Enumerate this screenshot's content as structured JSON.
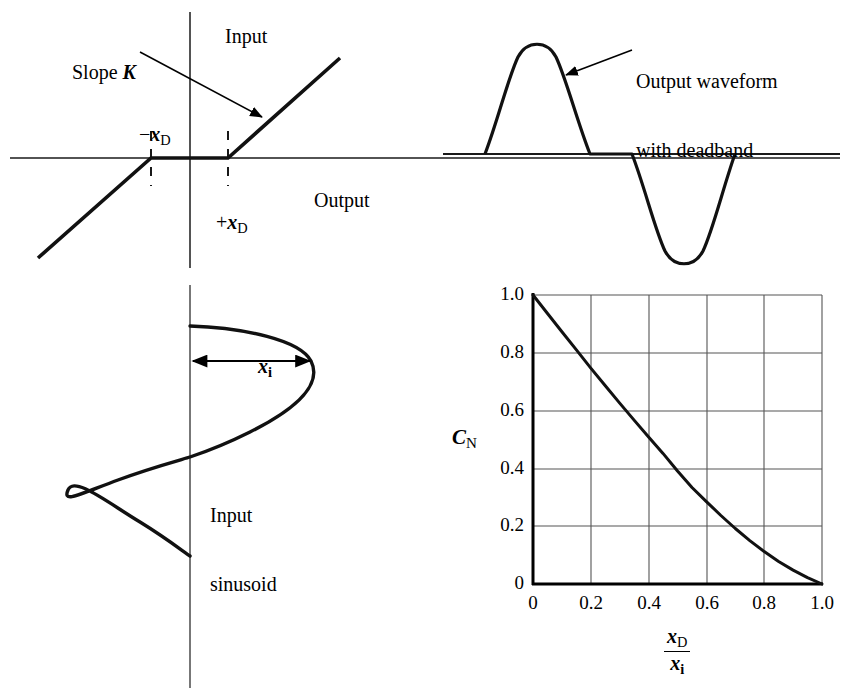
{
  "transfer_plot": {
    "axis_input_label": "Input",
    "axis_output_label": "Output",
    "slope_label_prefix": "Slope ",
    "slope_label_symbol": "K",
    "deadband_neg_sign": "−",
    "deadband_pos_sign": "+",
    "deadband_symbol": "x",
    "deadband_subscript": "D",
    "geometry": {
      "origin_x": 190,
      "origin_y": 158,
      "axis_x_left": 10,
      "axis_x_right": 840,
      "axis_y_top": 12,
      "axis_y_bottom": 268,
      "deadband_neg_x": 151,
      "deadband_pos_x": 228,
      "line_low_x": 38,
      "line_low_y": 258,
      "line_high_x": 340,
      "line_high_y": 58
    }
  },
  "output_waveform": {
    "annotation_line1": "Output waveform",
    "annotation_line2": "with deadband",
    "geometry": {
      "baseline_y": 154,
      "baseline_x_start": 443,
      "baseline_x_end": 840,
      "pos_start_x": 485,
      "pos_end_x": 590,
      "pos_peak_x": 537,
      "pos_peak_y": 42,
      "neg_start_x": 632,
      "neg_end_x": 735,
      "neg_trough_x": 684,
      "neg_trough_y": 267
    }
  },
  "input_sinusoid": {
    "label_line1": "Input",
    "label_line2": "sinusoid",
    "amplitude_symbol": "x",
    "amplitude_subscript": "i",
    "geometry": {
      "axis_x": 190,
      "axis_y_top": 285,
      "axis_y_bottom": 688,
      "peak_pos_x": 312,
      "peak_pos_y": 361,
      "peak_neg_x": 68,
      "peak_neg_y": 490,
      "wave_y_start": 326,
      "wave_y_end": 556,
      "arrow_y": 361,
      "arrow_x_start": 192,
      "arrow_x_end": 311
    }
  },
  "chart_data": {
    "type": "line",
    "title": "",
    "xlabel_numerator_symbol": "x",
    "xlabel_numerator_subscript": "D",
    "xlabel_denominator_symbol": "x",
    "xlabel_denominator_subscript": "i",
    "ylabel_symbol": "C",
    "ylabel_subscript": "N",
    "xlim": [
      0,
      1.0
    ],
    "ylim": [
      0,
      1.0
    ],
    "grid": true,
    "legend": "none",
    "xticks": [
      "0",
      "0.2",
      "0.4",
      "0.6",
      "0.8",
      "1.0"
    ],
    "xtick_values": [
      0,
      0.2,
      0.4,
      0.6,
      0.8,
      1.0
    ],
    "yticks": [
      "0",
      "0.2",
      "0.4",
      "0.6",
      "0.8",
      "1.0"
    ],
    "ytick_values": [
      0,
      0.2,
      0.4,
      0.6,
      0.8,
      1.0
    ],
    "series": [
      {
        "name": "C_N",
        "x": [
          0.0,
          0.05,
          0.1,
          0.15,
          0.2,
          0.25,
          0.3,
          0.35,
          0.4,
          0.45,
          0.5,
          0.55,
          0.6,
          0.65,
          0.7,
          0.75,
          0.8,
          0.85,
          0.9,
          0.95,
          1.0
        ],
        "values": [
          1.0,
          0.936,
          0.873,
          0.81,
          0.747,
          0.686,
          0.626,
          0.567,
          0.509,
          0.452,
          0.391,
          0.334,
          0.285,
          0.237,
          0.192,
          0.15,
          0.112,
          0.078,
          0.048,
          0.022,
          0.0
        ]
      }
    ],
    "geometry": {
      "plot_left": 533,
      "plot_right": 822,
      "plot_top": 295,
      "plot_bottom": 584
    }
  },
  "colors": {
    "ink": "#000000",
    "grid": "#555555",
    "background": "#ffffff"
  }
}
